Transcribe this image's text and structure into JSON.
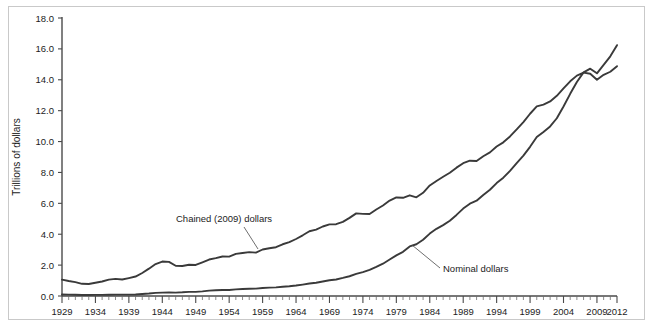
{
  "figure": {
    "background": "#ffffff",
    "frame_color": "#c9c9c9",
    "line_color": "#3a3a3a",
    "axis_color": "#4a4a4a"
  },
  "axis": {
    "ylabel": "Trillions of dollars",
    "y_ticks": [
      "0.0",
      "2.0",
      "4.0",
      "6.0",
      "8.0",
      "10.0",
      "12.0",
      "14.0",
      "16.0",
      "18.0"
    ],
    "x_ticks": [
      "1929",
      "1934",
      "1939",
      "1944",
      "1949",
      "1954",
      "1959",
      "1964",
      "1969",
      "1974",
      "1979",
      "1984",
      "1989",
      "1994",
      "1999",
      "2004",
      "2009",
      "2012"
    ]
  },
  "annotations": {
    "chained_label": "Chained (2009) dollars",
    "nominal_label": "Nominal dollars"
  },
  "chart_data": {
    "type": "line",
    "title": "",
    "xlabel": "",
    "ylabel": "Trillions of dollars",
    "xlim": [
      1929,
      2012
    ],
    "ylim": [
      0.0,
      18.0
    ],
    "grid": false,
    "legend": "inline-annotations",
    "x": [
      1929,
      1930,
      1931,
      1932,
      1933,
      1934,
      1935,
      1936,
      1937,
      1938,
      1939,
      1940,
      1941,
      1942,
      1943,
      1944,
      1945,
      1946,
      1947,
      1948,
      1949,
      1950,
      1951,
      1952,
      1953,
      1954,
      1955,
      1956,
      1957,
      1958,
      1959,
      1960,
      1961,
      1962,
      1963,
      1964,
      1965,
      1966,
      1967,
      1968,
      1969,
      1970,
      1971,
      1972,
      1973,
      1974,
      1975,
      1976,
      1977,
      1978,
      1979,
      1980,
      1981,
      1982,
      1983,
      1984,
      1985,
      1986,
      1987,
      1988,
      1989,
      1990,
      1991,
      1992,
      1993,
      1994,
      1995,
      1996,
      1997,
      1998,
      1999,
      2000,
      2001,
      2002,
      2003,
      2004,
      2005,
      2006,
      2007,
      2008,
      2009,
      2010,
      2011,
      2012
    ],
    "series": [
      {
        "name": "Chained (2009) dollars",
        "values": [
          1.06,
          0.97,
          0.9,
          0.79,
          0.78,
          0.86,
          0.94,
          1.06,
          1.11,
          1.07,
          1.16,
          1.26,
          1.49,
          1.77,
          2.07,
          2.23,
          2.21,
          1.96,
          1.94,
          2.02,
          2.01,
          2.18,
          2.36,
          2.45,
          2.56,
          2.55,
          2.73,
          2.78,
          2.84,
          2.81,
          3.01,
          3.09,
          3.16,
          3.35,
          3.49,
          3.69,
          3.93,
          4.19,
          4.3,
          4.5,
          4.64,
          4.65,
          4.8,
          5.06,
          5.35,
          5.32,
          5.31,
          5.6,
          5.86,
          6.18,
          6.38,
          6.36,
          6.52,
          6.39,
          6.68,
          7.16,
          7.45,
          7.72,
          7.98,
          8.31,
          8.6,
          8.76,
          8.74,
          9.05,
          9.3,
          9.68,
          9.95,
          10.33,
          10.79,
          11.26,
          11.8,
          12.28,
          12.39,
          12.6,
          12.96,
          13.44,
          13.9,
          14.27,
          14.46,
          14.39,
          14.0,
          14.32,
          14.52,
          14.88
        ]
      },
      {
        "name": "Nominal dollars",
        "values": [
          0.1,
          0.09,
          0.08,
          0.06,
          0.06,
          0.07,
          0.07,
          0.08,
          0.09,
          0.09,
          0.09,
          0.1,
          0.13,
          0.16,
          0.2,
          0.22,
          0.23,
          0.22,
          0.24,
          0.27,
          0.27,
          0.3,
          0.35,
          0.37,
          0.39,
          0.39,
          0.43,
          0.45,
          0.47,
          0.48,
          0.52,
          0.54,
          0.56,
          0.6,
          0.63,
          0.68,
          0.74,
          0.81,
          0.86,
          0.94,
          1.02,
          1.07,
          1.17,
          1.28,
          1.43,
          1.55,
          1.69,
          1.88,
          2.09,
          2.36,
          2.63,
          2.86,
          3.21,
          3.35,
          3.64,
          4.04,
          4.35,
          4.59,
          4.87,
          5.25,
          5.66,
          5.98,
          6.17,
          6.54,
          6.88,
          7.31,
          7.66,
          8.1,
          8.61,
          9.09,
          9.66,
          10.29,
          10.62,
          10.98,
          11.51,
          12.27,
          13.09,
          13.86,
          14.48,
          14.72,
          14.42,
          14.96,
          15.52,
          16.24
        ]
      }
    ]
  }
}
